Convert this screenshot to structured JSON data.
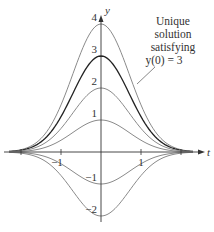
{
  "chart_data": {
    "type": "line",
    "title": "",
    "xlabel": "t",
    "ylabel": "y",
    "xlim": [
      -2.3,
      2.3
    ],
    "ylim": [
      -2.2,
      4.3
    ],
    "grid": false,
    "x_ticks": [
      -2,
      -1,
      1,
      2
    ],
    "x_tick_labels": [
      "-1",
      "1"
    ],
    "y_tick_labels": [
      "4",
      "3",
      "2",
      "1",
      "-1",
      "-2"
    ],
    "y_tick_values": [
      4,
      3,
      2,
      1,
      -1,
      -2
    ],
    "function": "y = C e^(-t^2)",
    "series": [
      {
        "name": "C=4",
        "C": 4,
        "highlight": false
      },
      {
        "name": "C=3",
        "C": 3,
        "highlight": true
      },
      {
        "name": "C=2",
        "C": 2,
        "highlight": false
      },
      {
        "name": "C=1",
        "C": 1,
        "highlight": false
      },
      {
        "name": "C=-1",
        "C": -1,
        "highlight": false
      },
      {
        "name": "C=-2",
        "C": -2,
        "highlight": false
      }
    ],
    "annotation": {
      "lines": [
        "Unique",
        "solution",
        "satisfying",
        "y(0) = 3"
      ],
      "points_to": "C=3"
    }
  },
  "axes": {
    "x_label": "t",
    "y_label": "y"
  },
  "colors": {
    "curve": "#8a8a8a",
    "highlight": "#222222",
    "axis": "#333333"
  }
}
